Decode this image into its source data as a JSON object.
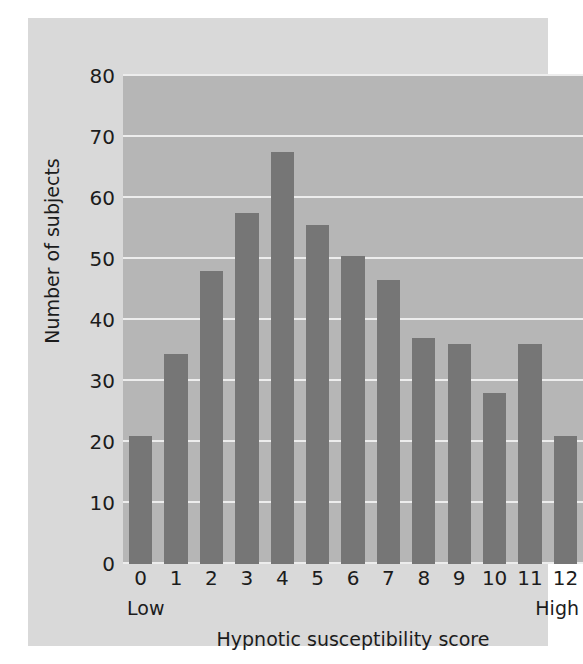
{
  "chart_data": {
    "type": "bar",
    "title": "",
    "xlabel": "Hypnotic susceptibility score",
    "ylabel": "Number of subjects",
    "categories": [
      "0",
      "1",
      "2",
      "3",
      "4",
      "5",
      "6",
      "7",
      "8",
      "9",
      "10",
      "11",
      "12"
    ],
    "values": [
      21,
      34.5,
      48,
      57.5,
      67.5,
      55.5,
      50.5,
      46.5,
      37,
      36,
      28,
      36,
      21
    ],
    "ylim": [
      0,
      80
    ],
    "y_ticks": [
      "0",
      "10",
      "20",
      "30",
      "40",
      "50",
      "60",
      "70",
      "80"
    ],
    "y_tick_values": [
      0,
      10,
      20,
      30,
      40,
      50,
      60,
      70,
      80
    ],
    "grid": true,
    "grid_axis": "y",
    "legend": "none",
    "axis_anchors": {
      "left": "Low",
      "right": "High"
    },
    "colors": {
      "bar": "#767676",
      "plot_background": "#b6b6b6",
      "figure_background": "#d9d9d9",
      "gridline": "#ededed",
      "text": "#1c1c1c"
    }
  }
}
